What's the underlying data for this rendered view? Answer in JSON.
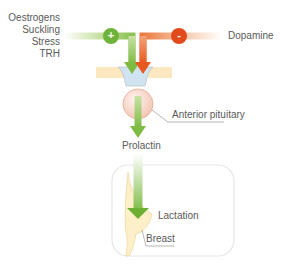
{
  "diagram": {
    "stimuli": [
      "Oestrogens",
      "Suckling",
      "Stress",
      "TRH"
    ],
    "inhibitor": "Dopamine",
    "stimulate_sign": "+",
    "inhibit_sign": "-",
    "pituitary_label": "Anterior pituitary",
    "hormone_label": "Prolactin",
    "effect_label": "Lactation",
    "target_label": "Breast"
  },
  "colors": {
    "green": "#7dbb42",
    "green_light": "#c9e2a6",
    "orange": "#e8581f",
    "orange_light": "#f6c7a7",
    "hypothalamus_band": "#fbe8c0",
    "stalk": "#cfe3f1",
    "pituitary": "#f8d9cf",
    "breast": "#fdf0c8",
    "box_border": "#e6e6e6",
    "text": "#5a5a5a"
  }
}
